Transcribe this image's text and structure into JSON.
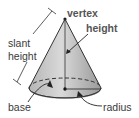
{
  "diagram": {
    "labels": {
      "vertex": "vertex",
      "height": "height",
      "slant_line1": "slant",
      "slant_line2": "height",
      "base": "base",
      "radius": "radius"
    },
    "colors": {
      "cone_fill_light": "#d8d8d8",
      "cone_fill_dark": "#9a9a9a",
      "outline": "#333333",
      "label_bold": "#555555",
      "label_regular": "#3a3a3a"
    }
  }
}
